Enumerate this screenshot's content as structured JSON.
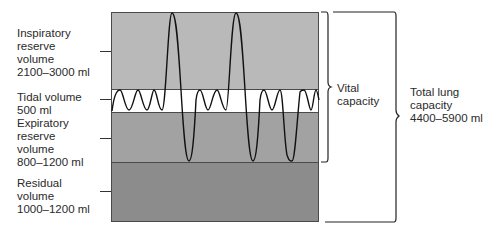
{
  "diagram": {
    "volumes": [
      {
        "name_line1": "Inspiratory",
        "name_line2": "reserve",
        "name_line3": "volume",
        "range": "2100–3000 ml",
        "color": "#b9b9b9"
      },
      {
        "name_line1": "Tidal volume",
        "range": "500 ml",
        "color": "#ffffff"
      },
      {
        "name_line1": "Expiratory",
        "name_line2": "reserve",
        "name_line3": "volume",
        "range": "800–1200 ml",
        "color": "#a2a2a2"
      },
      {
        "name_line1": "Residual",
        "name_line2": "volume",
        "range": "1000–1200 ml",
        "color": "#8c8c8c"
      }
    ],
    "capacities": [
      {
        "line1": "Vital",
        "line2": "capacity"
      },
      {
        "line1": "Total lung",
        "line2": "capacity",
        "line3": "4400–5900 ml"
      }
    ]
  }
}
